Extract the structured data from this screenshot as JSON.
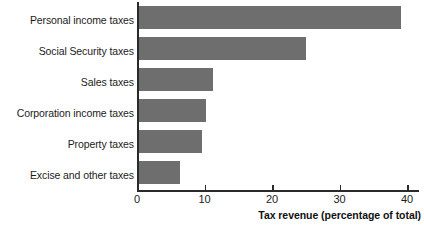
{
  "chart_data": {
    "type": "bar",
    "orientation": "horizontal",
    "title": "",
    "subtitle": "",
    "xlabel": "Tax revenue (percentage of total)",
    "ylabel": "",
    "xlim": [
      0,
      42
    ],
    "ylim": null,
    "grid": false,
    "legend": null,
    "bar_color": "#6e6e6e",
    "axis_color": "#2a2a2a",
    "x_ticks": [
      0,
      10,
      20,
      30,
      40
    ],
    "x_tick_labels": [
      "0",
      "10",
      "20",
      "30",
      "40"
    ],
    "categories": [
      "Personal income taxes",
      "Social Security taxes",
      "Sales taxes",
      "Corporation income taxes",
      "Property taxes",
      "Excise and other taxes"
    ],
    "values": [
      39,
      24.9,
      11.1,
      10,
      9.5,
      6.2
    ],
    "annotations": []
  },
  "axis": {
    "x_title": "Tax revenue (percentage of total)"
  }
}
